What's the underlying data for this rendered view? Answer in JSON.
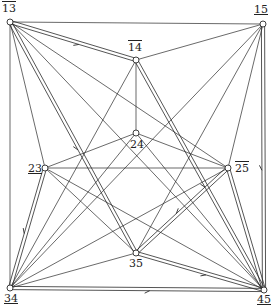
{
  "diagram": {
    "title": "",
    "stroke_color": "#2a2a2a",
    "node_fill": "#ffffff",
    "nodes": [
      {
        "id": "13",
        "label": "13",
        "mark": "over",
        "x": 10,
        "y": 22,
        "lx": 2,
        "ly": 3
      },
      {
        "id": "14",
        "label": "14",
        "mark": "over",
        "x": 136,
        "y": 60,
        "lx": 128,
        "ly": 42
      },
      {
        "id": "15",
        "label": "15",
        "mark": "under",
        "x": 263,
        "y": 24,
        "lx": 254,
        "ly": 4
      },
      {
        "id": "23",
        "label": "23",
        "mark": "under",
        "x": 45,
        "y": 168,
        "lx": 28,
        "ly": 163
      },
      {
        "id": "24",
        "label": "24",
        "mark": "none",
        "x": 136,
        "y": 133,
        "lx": 130,
        "ly": 139
      },
      {
        "id": "25",
        "label": "25",
        "mark": "over",
        "x": 228,
        "y": 168,
        "lx": 235,
        "ly": 163
      },
      {
        "id": "34",
        "label": "34",
        "mark": "under",
        "x": 10,
        "y": 288,
        "lx": 4,
        "ly": 293
      },
      {
        "id": "35",
        "label": "35",
        "mark": "none",
        "x": 136,
        "y": 253,
        "lx": 129,
        "ly": 258
      },
      {
        "id": "45",
        "label": "45",
        "mark": "under",
        "x": 264,
        "y": 290,
        "lx": 257,
        "ly": 294
      }
    ],
    "edges": [
      {
        "from": "13",
        "to": "15",
        "double": false,
        "arrow": false
      },
      {
        "from": "13",
        "to": "34",
        "double": false,
        "arrow": false
      },
      {
        "from": "15",
        "to": "45",
        "double": true,
        "arrow": true
      },
      {
        "from": "34",
        "to": "45",
        "double": true,
        "arrow": true
      },
      {
        "from": "13",
        "to": "14",
        "double": true,
        "arrow": true
      },
      {
        "from": "14",
        "to": "15",
        "double": false,
        "arrow": false
      },
      {
        "from": "13",
        "to": "35",
        "double": true,
        "arrow": true
      },
      {
        "from": "13",
        "to": "23",
        "double": false,
        "arrow": false
      },
      {
        "from": "13",
        "to": "25",
        "double": false,
        "arrow": false
      },
      {
        "from": "13",
        "to": "45",
        "double": false,
        "arrow": false
      },
      {
        "from": "14",
        "to": "24",
        "double": false,
        "arrow": false
      },
      {
        "from": "14",
        "to": "34",
        "double": false,
        "arrow": false
      },
      {
        "from": "14",
        "to": "45",
        "double": true,
        "arrow": true
      },
      {
        "from": "15",
        "to": "35",
        "double": false,
        "arrow": false
      },
      {
        "from": "15",
        "to": "34",
        "double": false,
        "arrow": false
      },
      {
        "from": "15",
        "to": "25",
        "double": false,
        "arrow": false
      },
      {
        "from": "23",
        "to": "24",
        "double": false,
        "arrow": false
      },
      {
        "from": "24",
        "to": "25",
        "double": false,
        "arrow": false
      },
      {
        "from": "23",
        "to": "25",
        "double": false,
        "arrow": false
      },
      {
        "from": "23",
        "to": "34",
        "double": true,
        "arrow": true
      },
      {
        "from": "23",
        "to": "35",
        "double": false,
        "arrow": false
      },
      {
        "from": "23",
        "to": "45",
        "double": false,
        "arrow": false
      },
      {
        "from": "25",
        "to": "35",
        "double": true,
        "arrow": true
      },
      {
        "from": "25",
        "to": "45",
        "double": true,
        "arrow": false
      },
      {
        "from": "25",
        "to": "34",
        "double": false,
        "arrow": false
      },
      {
        "from": "24",
        "to": "34",
        "double": false,
        "arrow": false
      },
      {
        "from": "24",
        "to": "45",
        "double": false,
        "arrow": false
      },
      {
        "from": "34",
        "to": "35",
        "double": false,
        "arrow": false
      },
      {
        "from": "35",
        "to": "45",
        "double": true,
        "arrow": true
      }
    ]
  }
}
